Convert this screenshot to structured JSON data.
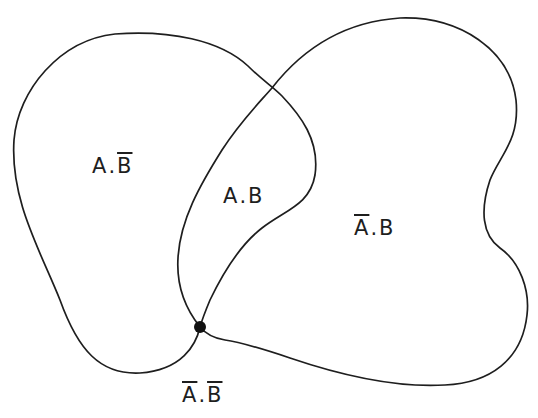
{
  "diagram": {
    "type": "venn-diagram",
    "sets": [
      {
        "name": "A",
        "description": "left blob"
      },
      {
        "name": "B",
        "description": "right blob"
      }
    ],
    "colors": {
      "stroke": "#1e1e1e",
      "background": "#ffffff",
      "junction_dot": "#111111"
    },
    "regions": [
      {
        "id": "a-not-b",
        "first": "A",
        "first_complement": false,
        "separator": ".",
        "second": "B",
        "second_complement": true
      },
      {
        "id": "a-and-b",
        "first": "A",
        "first_complement": false,
        "separator": ".",
        "second": "B",
        "second_complement": false
      },
      {
        "id": "not-a-and-b",
        "first": "A",
        "first_complement": true,
        "separator": ".",
        "second": "B",
        "second_complement": false
      },
      {
        "id": "not-a-not-b",
        "first": "A",
        "first_complement": true,
        "separator": ".",
        "second": "B",
        "second_complement": true
      }
    ],
    "labels": {
      "a_not_b": {
        "first": "A",
        "sep": ".",
        "second": "B"
      },
      "a_and_b": {
        "first": "A",
        "sep": ".",
        "second": "B"
      },
      "not_a_and_b": {
        "first": "A",
        "sep": ".",
        "second": "B"
      },
      "not_a_not_b": {
        "first": "A",
        "sep": ".",
        "second": "B"
      }
    },
    "junction_point": {
      "x": 200,
      "y": 327
    }
  }
}
